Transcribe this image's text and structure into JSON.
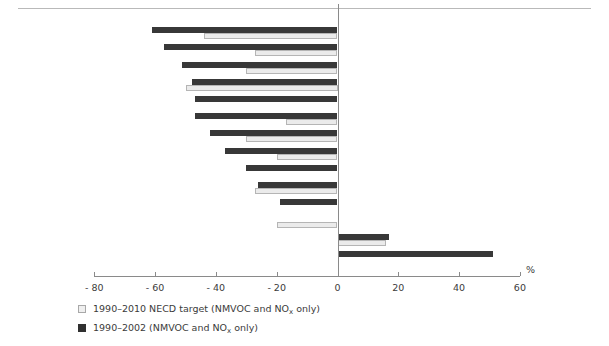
{
  "figure": {
    "top_partial_text": "",
    "axis_unit": "%"
  },
  "chart_data": {
    "type": "bar",
    "orientation": "horizontal",
    "title": "",
    "xlabel": "%",
    "ylabel": "",
    "xlim": [
      -80,
      60
    ],
    "xticks": [
      -80,
      -60,
      -40,
      -20,
      0,
      20,
      40,
      60
    ],
    "xtick_labels": [
      "- 80",
      "- 60",
      "- 40",
      "- 20",
      "0",
      "20",
      "40",
      "60"
    ],
    "grid": false,
    "legend_position": "below",
    "categories": [
      "Malta",
      "Slovakia",
      "Lithuania",
      "Estonia",
      "Czech Republic",
      "Bulgaria",
      "Latvia",
      "EU-10",
      "Poland",
      "Romania",
      "Hungary",
      "Croatia",
      "Slovenia",
      "Cyprus",
      "Turkey"
    ],
    "series": [
      {
        "name": "1990–2002 (NMVOC and NOx only)",
        "key": "dark",
        "color": "#383838",
        "values": [
          null,
          -61,
          -57,
          -51,
          -48,
          -47,
          -47,
          -42,
          -37,
          -30,
          -26,
          -19,
          null,
          17,
          51
        ]
      },
      {
        "name": "1990–2010 NECD target (NMVOC and NOx only)",
        "key": "light",
        "color": "#ebebeb",
        "values": [
          null,
          -44,
          -27,
          -30,
          -50,
          null,
          -17,
          -30,
          -20,
          null,
          -27,
          null,
          -20,
          16,
          null
        ]
      }
    ],
    "legend": [
      {
        "swatch": "light",
        "label_plain": "1990–2010 NECD target (NMVOC and NOx only)",
        "label_pre": "1990–2010 NECD target (NMVOC and NO",
        "label_sub": "x",
        "label_post": " only)"
      },
      {
        "swatch": "dark",
        "label_plain": "1990–2002 (NMVOC and NOx only)",
        "label_pre": "1990–2002 (NMVOC and NO",
        "label_sub": "x",
        "label_post": " only)"
      }
    ]
  }
}
